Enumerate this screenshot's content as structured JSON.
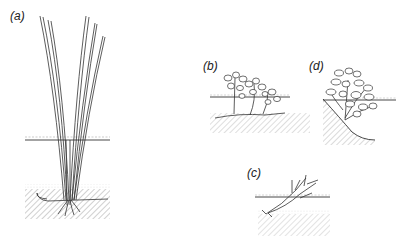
{
  "figure": {
    "panels": [
      {
        "id": "a",
        "label": "(a)",
        "description": "tall emergent plant with long leaves, water surface line and rooted sediment"
      },
      {
        "id": "b",
        "label": "(b)",
        "description": "floating-leaved plants rooted in sediment near water surface"
      },
      {
        "id": "c",
        "label": "(c)",
        "description": "small submerged shoot rooted in sediment below water surface"
      },
      {
        "id": "d",
        "label": "(d)",
        "description": "leafy plant growing on sloping bank at water's edge"
      }
    ],
    "colors": {
      "ink": "#333333",
      "hatch": "#8a8a8a",
      "background": "#ffffff"
    }
  }
}
